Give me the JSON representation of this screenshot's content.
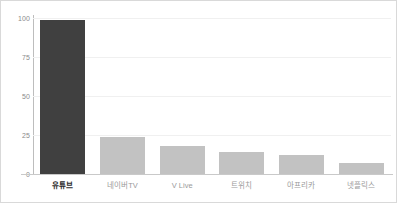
{
  "chart_data": {
    "type": "bar",
    "title": "",
    "subtitle": "",
    "xlabel": "",
    "ylabel": "",
    "categories": [
      "유튜브",
      "네이버TV",
      "V Live",
      "트위치",
      "아프리카",
      "넷플릭스"
    ],
    "values": [
      99,
      24,
      18,
      14,
      12,
      7
    ],
    "ylim": [
      0,
      100
    ],
    "yticks": [
      0,
      25,
      50,
      75,
      100
    ],
    "ytick_labels": [
      "0",
      "25",
      "50",
      "75",
      "100"
    ],
    "grid": true,
    "grid_axis": "y",
    "legend": false,
    "legend_position": "none",
    "highlight_index": 0,
    "bar_colors": [
      "#404040",
      "#c2c2c2",
      "#c2c2c2",
      "#c2c2c2",
      "#c2c2c2",
      "#c2c2c2"
    ],
    "label_colors": [
      "#2b2b2b",
      "#9a9a9a",
      "#9a9a9a",
      "#9a9a9a",
      "#9a9a9a",
      "#9a9a9a"
    ],
    "axis_color": "#bdbdbd",
    "gridline_color": "#f0f0f0",
    "background_color": "#ffffff",
    "border_color": "#d9d9d9"
  }
}
